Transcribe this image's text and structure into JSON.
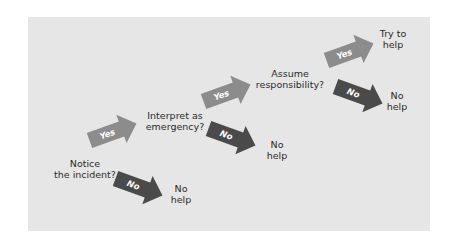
{
  "colors": {
    "panel_bg": "#e6e6e6",
    "yes_arrow": "#8c8c8c",
    "no_arrow": "#4a4a4a",
    "text": "#2a2a2a"
  },
  "stages": [
    {
      "question_line1": "Notice",
      "question_line2": "the incident?",
      "no_outcome_line1": "No",
      "no_outcome_line2": "help"
    },
    {
      "question_line1": "Interpret as",
      "question_line2": "emergency?",
      "no_outcome_line1": "No",
      "no_outcome_line2": "help"
    },
    {
      "question_line1": "Assume",
      "question_line2": "responsibility?",
      "no_outcome_line1": "No",
      "no_outcome_line2": "help"
    }
  ],
  "final_outcome": {
    "line1": "Try to",
    "line2": "help"
  },
  "arrows": {
    "yes_label": "Yes",
    "no_label": "No"
  }
}
